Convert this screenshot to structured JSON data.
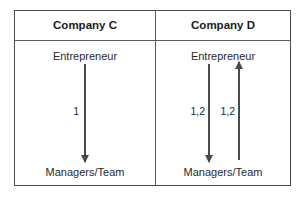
{
  "figure": {
    "columns": [
      {
        "header": "Company C",
        "top_node": "Entrepreneur",
        "bottom_node": "Managers/Team",
        "flows": [
          {
            "label": "1",
            "direction": "down"
          }
        ]
      },
      {
        "header": "Company D",
        "top_node": "Entrepreneur",
        "bottom_node": "Managers/Team",
        "flows": [
          {
            "label": "1,2",
            "direction": "down"
          },
          {
            "label": "1,2",
            "direction": "up"
          }
        ]
      }
    ],
    "colors": {
      "border": "#4a4a4a",
      "rule": "#5a5a5a",
      "arrow": "#4a4a4a",
      "header_text": "#1c1c1c",
      "body_text": "#2a2a2a",
      "background": "#ffffff"
    }
  }
}
